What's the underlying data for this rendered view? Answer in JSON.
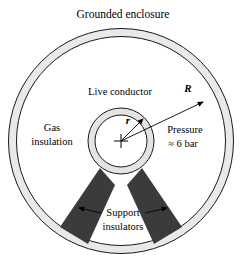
{
  "figure": {
    "title": "Grounded enclosure",
    "geometry": {
      "center_x": 121,
      "center_y": 141,
      "enclosure_outer_radius": 113,
      "enclosure_inner_radius": 105,
      "conductor_outer_radius": 33,
      "conductor_inner_radius": 26,
      "support_left_angle_deg": 235,
      "support_right_angle_deg": 305
    },
    "labels": {
      "enclosure": "Grounded enclosure",
      "conductor": "Live conductor",
      "gas_line1": "Gas",
      "gas_line2": "insulation",
      "pressure_line1": "Pressure",
      "pressure_line2": "≈ 6 bar",
      "supports_line1": "Support",
      "supports_line2": "insulators",
      "radius_outer_symbol": "R",
      "radius_inner_symbol": "r"
    },
    "colors": {
      "enclosure_fill": "#e9e9e9",
      "conductor_fill": "#e4e4e4",
      "core_fill": "#ffffff",
      "support_fill": "#3b3b3b",
      "outline": "#1a1a1a",
      "background": "#ffffff"
    },
    "values": {
      "pressure_text": "≈ 6 bar",
      "pressure_magnitude": 6,
      "pressure_unit": "bar"
    }
  }
}
